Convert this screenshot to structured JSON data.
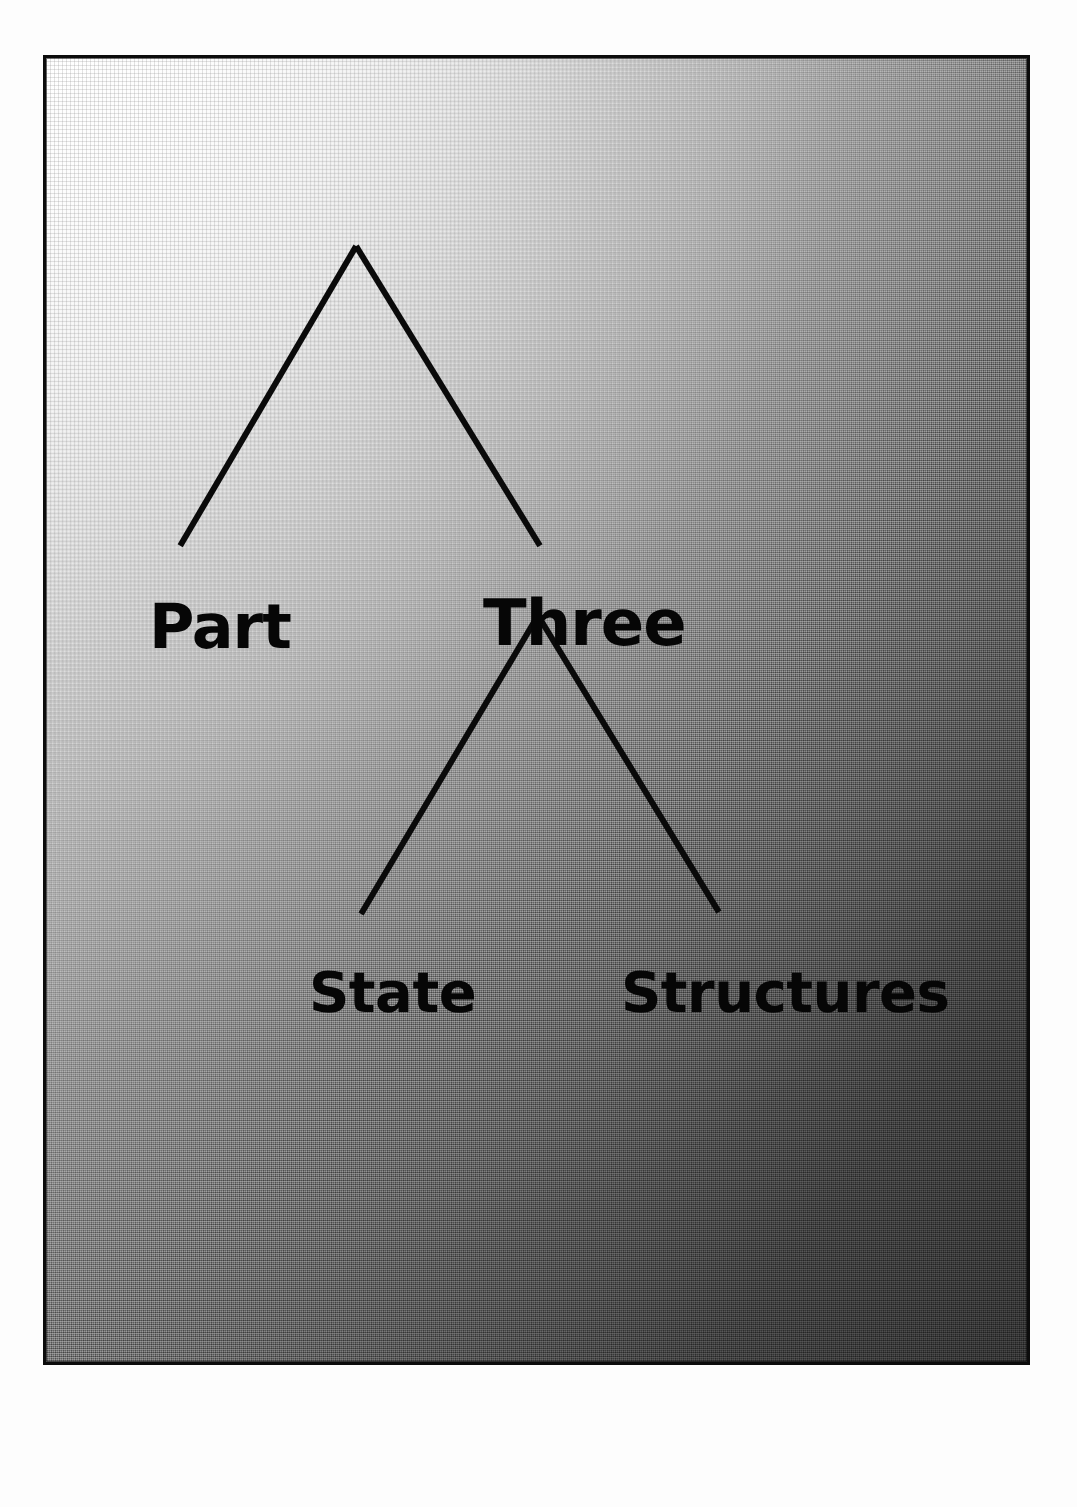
{
  "page": {
    "kind": "book-part-title-page",
    "background_color": "#ffffff"
  },
  "panel": {
    "border_color": "#0c0c0c",
    "gradient_from": "#f4f4f4",
    "gradient_to": "#3a3a3a",
    "gradient_direction": "top-left-light-to-bottom-right-dark",
    "texture": "halftone-dot-screen"
  },
  "diagram": {
    "type": "tree",
    "line_color": "#0a0a0a",
    "line_width": 6,
    "nodes": [
      {
        "id": "part",
        "label": "Part",
        "level": 1,
        "x": 178,
        "y": 572
      },
      {
        "id": "three",
        "label": "Three",
        "level": 1,
        "x": 540,
        "y": 568
      },
      {
        "id": "state",
        "label": "State",
        "level": 2,
        "x": 357,
        "y": 940
      },
      {
        "id": "structures",
        "label": "Structures",
        "level": 2,
        "x": 762,
        "y": 940
      }
    ],
    "apexes": [
      {
        "id": "apex-top",
        "x": 355,
        "y": 244
      },
      {
        "id": "apex-bottom",
        "x": 538,
        "y": 615
      }
    ],
    "edges": [
      {
        "from": "apex-top",
        "to": "part",
        "x1": 355,
        "y1": 244,
        "x2": 178,
        "y2": 545
      },
      {
        "from": "apex-top",
        "to": "three",
        "x1": 355,
        "y1": 244,
        "x2": 540,
        "y2": 545
      },
      {
        "from": "apex-bottom",
        "to": "state",
        "x1": 538,
        "y1": 615,
        "x2": 360,
        "y2": 915
      },
      {
        "from": "apex-bottom",
        "to": "structures",
        "x1": 538,
        "y1": 615,
        "x2": 720,
        "y2": 913
      }
    ]
  },
  "labels": {
    "part": "Part",
    "three": "Three",
    "state": "State",
    "structures": "Structures"
  },
  "title_text": {
    "part_line": "Part Three",
    "subtitle_line": "State Structures"
  }
}
